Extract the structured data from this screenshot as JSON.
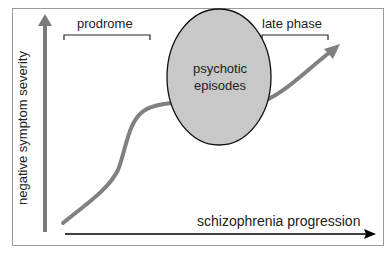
{
  "diagram": {
    "y_axis_label": "negative symptom severity",
    "x_axis_label": "schizophrenia progression",
    "phases": {
      "prodrome": "prodrome",
      "late_phase": "late phase"
    },
    "ellipse": {
      "line1": "psychotic",
      "line2": "episodes"
    },
    "colors": {
      "curve": "#808080",
      "ellipse_fill": "#c8c8c8",
      "y_axis": "#7a7a7a",
      "x_axis": "#000000",
      "frame": "#9a9a9a"
    }
  }
}
